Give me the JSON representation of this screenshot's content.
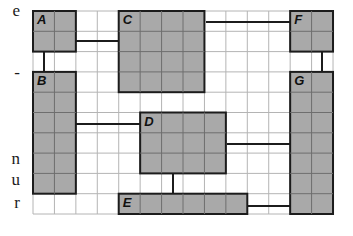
{
  "margin_text": [
    {
      "text": "e",
      "top": 2
    },
    {
      "text": "-",
      "top": 64
    },
    {
      "text": "n",
      "top": 150
    },
    {
      "text": "u",
      "top": 171
    },
    {
      "text": "r",
      "top": 194
    }
  ],
  "grid": {
    "origin_x": 33,
    "origin_y": 11,
    "cols": 14,
    "rows": 10,
    "cell_w": 21.43,
    "cell_h": 20.3,
    "line_color": "#b4b4b4",
    "border_color": "#9a9a9a"
  },
  "colors": {
    "block_fill": "#a9a9a9",
    "block_border": "#1c1c1c",
    "connector": "#1c1c1c"
  },
  "blocks": [
    {
      "id": "A",
      "label": "A",
      "col": 0,
      "row": 0,
      "w": 2,
      "h": 2
    },
    {
      "id": "C",
      "label": "C",
      "col": 4,
      "row": 0,
      "w": 4,
      "h": 4
    },
    {
      "id": "F",
      "label": "F",
      "col": 12,
      "row": 0,
      "w": 2,
      "h": 2
    },
    {
      "id": "B",
      "label": "B",
      "col": 0,
      "row": 3,
      "w": 2,
      "h": 6
    },
    {
      "id": "D",
      "label": "D",
      "col": 5,
      "row": 5,
      "w": 4,
      "h": 3
    },
    {
      "id": "G",
      "label": "G",
      "col": 12,
      "row": 3,
      "w": 2,
      "h": 7
    },
    {
      "id": "E",
      "label": "E",
      "col": 4,
      "row": 9,
      "w": 6,
      "h": 1
    }
  ],
  "connectors": [
    {
      "from": "A",
      "to": "C",
      "x1": 76,
      "y1": 41,
      "x2": 120,
      "y2": 41
    },
    {
      "from": "C",
      "to": "F",
      "x1": 206,
      "y1": 22,
      "x2": 291,
      "y2": 22
    },
    {
      "from": "A",
      "to": "B",
      "x1": 44,
      "y1": 52,
      "x2": 44,
      "y2": 72
    },
    {
      "from": "F",
      "to": "G",
      "x1": 322,
      "y1": 52,
      "x2": 322,
      "y2": 72
    },
    {
      "from": "B",
      "to": "D",
      "x1": 76,
      "y1": 124,
      "x2": 141,
      "y2": 124
    },
    {
      "from": "D",
      "to": "G",
      "x1": 227,
      "y1": 144,
      "x2": 291,
      "y2": 144
    },
    {
      "from": "D",
      "to": "E",
      "x1": 173,
      "y1": 174,
      "x2": 173,
      "y2": 194
    },
    {
      "from": "E",
      "to": "G",
      "x1": 248,
      "y1": 206,
      "x2": 291,
      "y2": 206
    }
  ]
}
